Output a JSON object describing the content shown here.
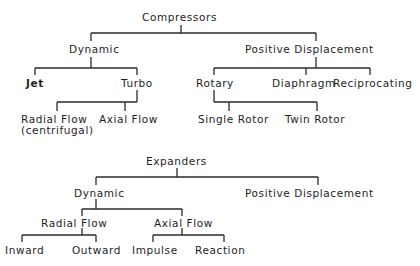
{
  "compressors": {
    "root": "Compressors",
    "dynamic": {
      "label": "Dynamic",
      "children": {
        "jet": "Jet",
        "turbo": {
          "label": "Turbo",
          "children": {
            "radial_flow_line1": "Radial Flow",
            "radial_flow_line2": "(centrifugal)",
            "axial_flow": "Axial Flow"
          }
        }
      }
    },
    "positive_displacement": {
      "label": "Positive Displacement",
      "children": {
        "rotary": {
          "label": "Rotary",
          "children": {
            "single_rotor": "Single Rotor",
            "twin_rotor": "Twin Rotor"
          }
        },
        "diaphragm": "Diaphragm",
        "reciprocating": "Reciprocating"
      }
    }
  },
  "expanders": {
    "root": "Expanders",
    "dynamic": {
      "label": "Dynamic",
      "children": {
        "radial_flow": {
          "label": "Radial Flow",
          "children": {
            "inward": "Inward",
            "outward": "Outward"
          }
        },
        "axial_flow": {
          "label": "Axial Flow",
          "children": {
            "impulse": "Impulse",
            "reaction": "Reaction"
          }
        }
      }
    },
    "positive_displacement": {
      "label": "Positive Displacement"
    }
  }
}
